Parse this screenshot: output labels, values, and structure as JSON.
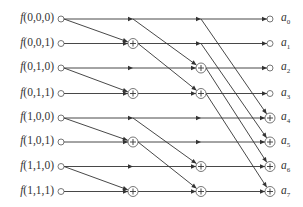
{
  "diagram": {
    "type": "butterfly-signal-flow-graph",
    "inputs": [
      {
        "label": "f(0,0,0)"
      },
      {
        "label": "f(0,0,1)"
      },
      {
        "label": "f(0,1,0)"
      },
      {
        "label": "f(0,1,1)"
      },
      {
        "label": "f(1,0,0)"
      },
      {
        "label": "f(1,0,1)"
      },
      {
        "label": "f(1,1,0)"
      },
      {
        "label": "f(1,1,1)"
      }
    ],
    "outputs": [
      {
        "base": "a",
        "sub": "0",
        "node": "open"
      },
      {
        "base": "a",
        "sub": "1",
        "node": "open"
      },
      {
        "base": "a",
        "sub": "2",
        "node": "open"
      },
      {
        "base": "a",
        "sub": "3",
        "node": "open"
      },
      {
        "base": "a",
        "sub": "4",
        "node": "sum"
      },
      {
        "base": "a",
        "sub": "5",
        "node": "sum"
      },
      {
        "base": "a",
        "sub": "6",
        "node": "sum"
      },
      {
        "base": "a",
        "sub": "7",
        "node": "sum"
      }
    ],
    "stages": [
      {
        "stride": 1,
        "sum_rows": [
          1,
          3,
          5,
          7
        ]
      },
      {
        "stride": 2,
        "sum_rows": [
          2,
          3,
          6,
          7
        ]
      },
      {
        "stride": 4,
        "sum_rows": [
          4,
          5,
          6,
          7
        ]
      }
    ],
    "node_symbol_sum": "+",
    "colors": {
      "line": "#333333",
      "node": "#555555",
      "text": "#333333"
    }
  }
}
